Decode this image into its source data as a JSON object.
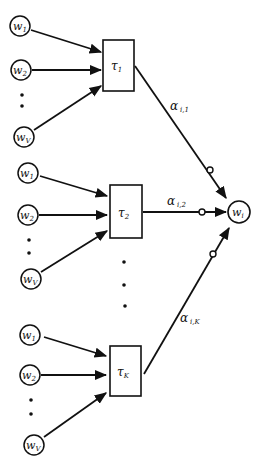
{
  "diagram": {
    "type": "network",
    "groups": [
      {
        "inputs": [
          {
            "label": "w",
            "sub": "1"
          },
          {
            "label": "w",
            "sub": "2"
          },
          {
            "label": "w",
            "sub": "V"
          }
        ],
        "box": {
          "label": "τ",
          "sub": "1"
        },
        "edge": {
          "label": "α",
          "sub": "i,1"
        }
      },
      {
        "inputs": [
          {
            "label": "w",
            "sub": "1"
          },
          {
            "label": "w",
            "sub": "2"
          },
          {
            "label": "w",
            "sub": "V"
          }
        ],
        "box": {
          "label": "τ",
          "sub": "2"
        },
        "edge": {
          "label": "α",
          "sub": "i,2"
        }
      },
      {
        "inputs": [
          {
            "label": "w",
            "sub": "1"
          },
          {
            "label": "w",
            "sub": "2"
          },
          {
            "label": "w",
            "sub": "V"
          }
        ],
        "box": {
          "label": "τ",
          "sub": "K"
        },
        "edge": {
          "label": "α",
          "sub": "i,K"
        }
      }
    ],
    "output": {
      "label": "w",
      "sub": "i"
    },
    "colors": {
      "stroke": "#111111",
      "background": "#ffffff"
    }
  }
}
